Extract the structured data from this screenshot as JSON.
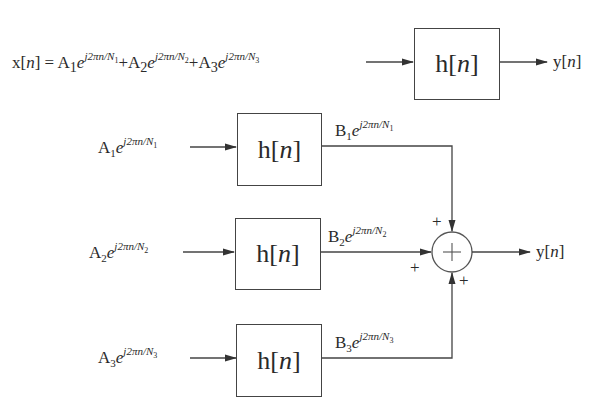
{
  "diagram": {
    "type": "block-diagram",
    "colors": {
      "stroke": "#444444",
      "text": "#2a2a2a",
      "background": "#ffffff"
    },
    "top_row": {
      "input_lhs": "x[n] =",
      "input_terms": [
        {
          "coef": "A",
          "coef_sub": "1",
          "exp_base": "e",
          "exp": "j2πn/N",
          "exp_sub": "1"
        },
        {
          "coef": "A",
          "coef_sub": "2",
          "exp_base": "e",
          "exp": "j2πn/N",
          "exp_sub": "2"
        },
        {
          "coef": "A",
          "coef_sub": "3",
          "exp_base": "e",
          "exp": "j2πn/N",
          "exp_sub": "3"
        }
      ],
      "plus": "+",
      "system_label": "h[n]",
      "output_label": "y[n]"
    },
    "branches": [
      {
        "input": {
          "coef": "A",
          "coef_sub": "1",
          "exp_base": "e",
          "exp": "j2πn/N",
          "exp_sub": "1"
        },
        "system_label": "h[n]",
        "output": {
          "coef": "B",
          "coef_sub": "1",
          "exp_base": "e",
          "exp": "j2πn/N",
          "exp_sub": "1"
        },
        "sign": "+"
      },
      {
        "input": {
          "coef": "A",
          "coef_sub": "2",
          "exp_base": "e",
          "exp": "j2πn/N",
          "exp_sub": "2"
        },
        "system_label": "h[n]",
        "output": {
          "coef": "B",
          "coef_sub": "2",
          "exp_base": "e",
          "exp": "j2πn/N",
          "exp_sub": "2"
        },
        "sign": "+"
      },
      {
        "input": {
          "coef": "A",
          "coef_sub": "3",
          "exp_base": "e",
          "exp": "j2πn/N",
          "exp_sub": "3"
        },
        "system_label": "h[n]",
        "output": {
          "coef": "B",
          "coef_sub": "3",
          "exp_base": "e",
          "exp": "j2πn/N",
          "exp_sub": "3"
        },
        "sign": "+"
      }
    ],
    "summer": {
      "symbol": "+",
      "output_label": "y[n]"
    }
  }
}
